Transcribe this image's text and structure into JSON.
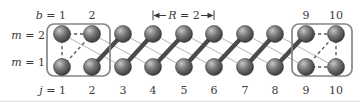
{
  "labels": {
    "b": {
      "variable": "b",
      "rest": " = 1"
    },
    "top_numbers": [
      "2",
      "9",
      "10"
    ],
    "R": {
      "variable": "R",
      "rest": " = 2"
    },
    "m2": {
      "variable": "m",
      "rest": " = 2"
    },
    "m1": {
      "variable": "m",
      "rest": " = 1"
    },
    "j": {
      "variable": "j",
      "rest": " = 1"
    },
    "j_numbers": [
      "2",
      "3",
      "4",
      "5",
      "6",
      "7",
      "8",
      "9",
      "10"
    ],
    "dimension": {
      "between_columns": [
        4,
        6
      ]
    }
  },
  "diagram": {
    "columns_x": [
      62,
      92,
      123,
      153,
      184,
      214,
      245,
      275,
      306,
      336
    ],
    "row_y": {
      "m2": 34,
      "m1": 67
    },
    "node_radius": 8.5,
    "rows": 2,
    "columns": 10,
    "long_range_links": [
      [
        1,
        3
      ],
      [
        2,
        4
      ],
      [
        3,
        5
      ],
      [
        4,
        6
      ],
      [
        5,
        7
      ],
      [
        6,
        8
      ],
      [
        7,
        9
      ],
      [
        8,
        10
      ]
    ],
    "dimer_bonds": [
      [
        2,
        3
      ],
      [
        3,
        4
      ],
      [
        4,
        5
      ],
      [
        5,
        6
      ],
      [
        6,
        7
      ],
      [
        7,
        8
      ],
      [
        8,
        9
      ]
    ],
    "dashed_links": [
      [
        1,
        2,
        2,
        2
      ],
      [
        1,
        2,
        1,
        1
      ],
      [
        1,
        1,
        2,
        2
      ],
      [
        9,
        2,
        10,
        2
      ],
      [
        9,
        1,
        10,
        1
      ],
      [
        10,
        2,
        10,
        1
      ],
      [
        9,
        1,
        10,
        2
      ]
    ],
    "unit_cell_boxes": [
      {
        "x": 47,
        "y": 24,
        "w": 63,
        "h": 52
      },
      {
        "x": 292,
        "y": 24,
        "w": 60,
        "h": 52
      }
    ]
  },
  "colors": {
    "sphere_light": "#c6c6c6",
    "sphere_mid": "#787878",
    "sphere_dark": "#262626",
    "dimer_bond": "#4a4a4a",
    "long_range_line": "#b2b2b2",
    "dashed_line": "#5c5c5c",
    "cell_box": "#878787",
    "text": "#3a3a3a",
    "background": "#ffffff"
  }
}
